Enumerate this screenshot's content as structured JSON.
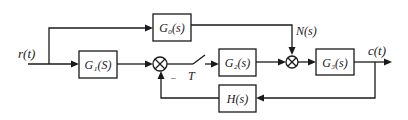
{
  "diagram": {
    "type": "control-system-block-diagram",
    "input_label": "r(t)",
    "output_label": "c(t)",
    "disturbance_label": "N(s)",
    "sampler_label": "T",
    "feedback_sign": "−",
    "blocks": {
      "g0": "G₀(s)",
      "g1": "G₁(S)",
      "g2": "G₂(s)",
      "g3": "G₃(s)",
      "h": "H(s)"
    },
    "summing_junctions": [
      {
        "id": "sum1",
        "inputs": [
          "G1(S) output",
          "H(s) feedback (−)"
        ]
      },
      {
        "id": "sum2",
        "inputs": [
          "G2(s) output",
          "G0(s) output / N(s)"
        ]
      }
    ],
    "colors": {
      "stroke": "#1a1a1a",
      "background": "#ffffff"
    }
  }
}
